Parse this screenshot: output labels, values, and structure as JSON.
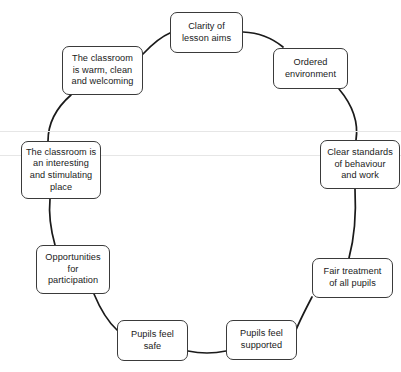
{
  "diagram": {
    "type": "cycle",
    "title": "",
    "shape": "circle",
    "background_color": "#ffffff",
    "line_color": "#1a1a1a",
    "box_border_color": "#3a3a3a",
    "rule_color": "#e6e6e6",
    "nodes": [
      {
        "id": "clarity-of-lesson-aims",
        "label": "Clarity of\nlesson aims",
        "position": "top",
        "x": 170,
        "y": 12,
        "w": 73,
        "h": 41
      },
      {
        "id": "ordered-environment",
        "label": "Ordered\nenvironment",
        "position": "top-right",
        "x": 273,
        "y": 48,
        "w": 75,
        "h": 41
      },
      {
        "id": "clear-standards-of-behaviour-and-work",
        "label": "Clear standards\nof behaviour\nand work",
        "position": "right",
        "x": 320,
        "y": 140,
        "w": 80,
        "h": 49
      },
      {
        "id": "fair-treatment-of-all-pupils",
        "label": "Fair treatment\nof all pupils",
        "position": "bottom-right",
        "x": 312,
        "y": 258,
        "w": 81,
        "h": 40
      },
      {
        "id": "pupils-feel-supported",
        "label": "Pupils feel\nsupported",
        "position": "bottom",
        "x": 226,
        "y": 320,
        "w": 71,
        "h": 40
      },
      {
        "id": "pupils-feel-safe",
        "label": "Pupils feel\nsafe",
        "position": "bottom",
        "x": 117,
        "y": 320,
        "w": 71,
        "h": 41
      },
      {
        "id": "opportunities-for-participation",
        "label": "Opportunities\nfor\nparticipation",
        "position": "bottom-left",
        "x": 36,
        "y": 245,
        "w": 74,
        "h": 49
      },
      {
        "id": "the-classroom-is-an-interesting-and-stimulating-place",
        "label": "The classroom is\nan interesting\nand stimulating\nplace",
        "position": "left",
        "x": 21,
        "y": 141,
        "w": 80,
        "h": 58
      },
      {
        "id": "the-classroom-is-warm-clean-and-welcoming",
        "label": "The classroom\nis warm, clean\nand welcoming",
        "position": "top-left",
        "x": 62,
        "y": 46,
        "w": 81,
        "h": 49
      }
    ],
    "rules": [
      {
        "id": "rule-upper",
        "y": 131
      },
      {
        "id": "rule-lower",
        "y": 155
      }
    ],
    "circle": {
      "cx": 200,
      "cy": 188,
      "r": 150
    }
  }
}
